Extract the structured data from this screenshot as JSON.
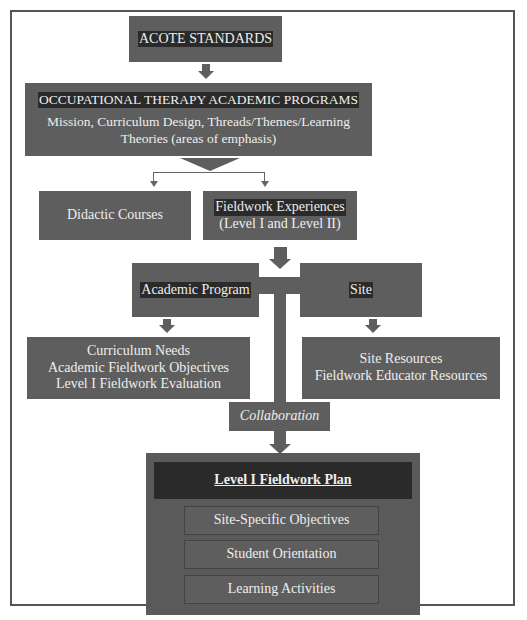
{
  "diagram": {
    "title_box": "ACOTE STANDARDS",
    "programs": {
      "title": "OCCUPATIONAL THERAPY ACADEMIC PROGRAMS",
      "line1": "Mission, Curriculum Design, Threads/Themes/Learning",
      "line2": "Theories (areas of emphasis)"
    },
    "didactic": "Didactic Courses",
    "fieldwork": {
      "line1": "Fieldwork Experiences",
      "line2": "(Level I and Level II)"
    },
    "academic_program": "Academic Program",
    "site": "Site",
    "academic_needs": {
      "line1": "Curriculum Needs",
      "line2": "Academic Fieldwork Objectives",
      "line3": "Level I Fieldwork Evaluation"
    },
    "site_resources": {
      "line1": "Site Resources",
      "line2": "Fieldwork Educator Resources"
    },
    "collaboration": "Collaboration",
    "plan": {
      "title": "Level I Fieldwork Plan",
      "items": [
        "Site-Specific Objectives",
        "Student Orientation",
        "Learning Activities"
      ]
    },
    "colors": {
      "box": "#5e5e5e",
      "dark": "#2a2a2a",
      "text": "#eeeeee"
    }
  }
}
